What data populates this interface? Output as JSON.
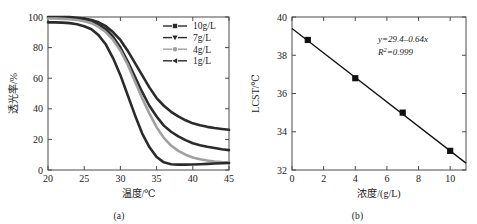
{
  "figure": {
    "panels": [
      {
        "id": "a",
        "caption": "(a)",
        "xlabel": "温度/℃",
        "ylabel": "透光率/%"
      },
      {
        "id": "b",
        "caption": "(b)",
        "xlabel": "浓度/(g/L)",
        "ylabel": "LCST/℃"
      }
    ]
  },
  "chart_data": [
    {
      "id": "panel-a",
      "type": "line",
      "title": "",
      "xlabel": "温度/℃",
      "ylabel": "透光率/%",
      "xlim": [
        20,
        45
      ],
      "ylim": [
        0,
        100
      ],
      "xticks": [
        20,
        25,
        30,
        35,
        40,
        45
      ],
      "yticks": [
        0,
        20,
        40,
        60,
        80,
        100
      ],
      "xticklabels": [
        "20",
        "25",
        "30",
        "35",
        "40",
        "45"
      ],
      "yticklabels": [
        "0",
        "20",
        "40",
        "60",
        "80",
        "100"
      ],
      "grid": false,
      "legend_position": "upper-right",
      "series": [
        {
          "name": "10g/L",
          "marker": "square",
          "color": "#2b2b2b",
          "x": [
            20,
            21,
            22,
            23,
            24,
            25,
            26,
            27,
            28,
            29,
            30,
            31,
            32,
            33,
            34,
            35,
            36,
            37,
            38,
            39,
            40,
            41,
            42,
            43,
            44,
            45
          ],
          "y": [
            100,
            100,
            100,
            100,
            99.5,
            99,
            98,
            96.5,
            94,
            90,
            85,
            78,
            70,
            62,
            54,
            47,
            42,
            38,
            35,
            32.5,
            30.5,
            29.2,
            28.2,
            27.4,
            26.8,
            26.3
          ]
        },
        {
          "name": "7g/L",
          "marker": "triangle-down",
          "color": "#2b2b2b",
          "x": [
            20,
            21,
            22,
            23,
            24,
            25,
            26,
            27,
            28,
            29,
            30,
            31,
            32,
            33,
            34,
            35,
            36,
            37,
            38,
            39,
            40,
            41,
            42,
            43,
            44,
            45
          ],
          "y": [
            99.5,
            99.5,
            99.3,
            99,
            98.5,
            98,
            97,
            95,
            92,
            87,
            80,
            71,
            61,
            51,
            42,
            35,
            29,
            25,
            22,
            19.5,
            17.5,
            16.2,
            15.2,
            14.4,
            13.6,
            13
          ]
        },
        {
          "name": "4g/L",
          "marker": "circle",
          "color": "#a0a0a0",
          "x": [
            20,
            21,
            22,
            23,
            24,
            25,
            26,
            27,
            28,
            29,
            30,
            31,
            32,
            33,
            34,
            35,
            36,
            37,
            38,
            39,
            40,
            41,
            42,
            43,
            44,
            45
          ],
          "y": [
            99,
            99,
            98.8,
            98.5,
            98,
            97.2,
            96,
            93.5,
            90,
            85,
            78,
            69,
            58,
            47,
            37,
            28,
            21,
            16,
            12.5,
            10,
            8.2,
            7,
            6.2,
            5.6,
            5.2,
            5
          ]
        },
        {
          "name": "1g/L",
          "marker": "triangle-left",
          "color": "#2b2b2b",
          "x": [
            20,
            21,
            22,
            23,
            24,
            25,
            26,
            27,
            28,
            29,
            30,
            31,
            32,
            33,
            34,
            35,
            36,
            37,
            38,
            39,
            40,
            41,
            42,
            43,
            44,
            45
          ],
          "y": [
            96.5,
            96.5,
            96.3,
            96,
            95.3,
            94,
            92,
            88,
            82,
            73,
            62,
            49,
            36,
            24,
            15,
            8.5,
            5,
            3.8,
            3.5,
            3.5,
            3.6,
            3.8,
            4,
            4.2,
            4.4,
            4.6
          ]
        }
      ]
    },
    {
      "id": "panel-b",
      "type": "scatter",
      "title": "",
      "xlabel": "浓度/(g/L)",
      "ylabel": "LCST/℃",
      "xlim": [
        0,
        11
      ],
      "ylim": [
        32,
        40
      ],
      "xticks": [
        0,
        2,
        4,
        6,
        8,
        10
      ],
      "yticks": [
        32,
        34,
        36,
        38,
        40
      ],
      "xticklabels": [
        "0",
        "2",
        "4",
        "6",
        "8",
        "10"
      ],
      "yticklabels": [
        "32",
        "34",
        "36",
        "38",
        "40"
      ],
      "grid": false,
      "marker": "square",
      "color": "#111111",
      "x": [
        1,
        4,
        7,
        10
      ],
      "y": [
        38.8,
        36.8,
        35.0,
        33.0
      ],
      "fit_line": {
        "slope": -0.64,
        "intercept": 39.4,
        "x_start": 0,
        "x_end": 11
      },
      "annotations": {
        "equation_y": "y",
        "equation_rest": "=29.4–0.64",
        "equation_x": "x",
        "equation_full": "y=29.4–0.64x",
        "r2_symbol": "R",
        "r2_sup": "2",
        "r2_value": "=0.999",
        "r2_full": "R²=0.999"
      }
    }
  ]
}
